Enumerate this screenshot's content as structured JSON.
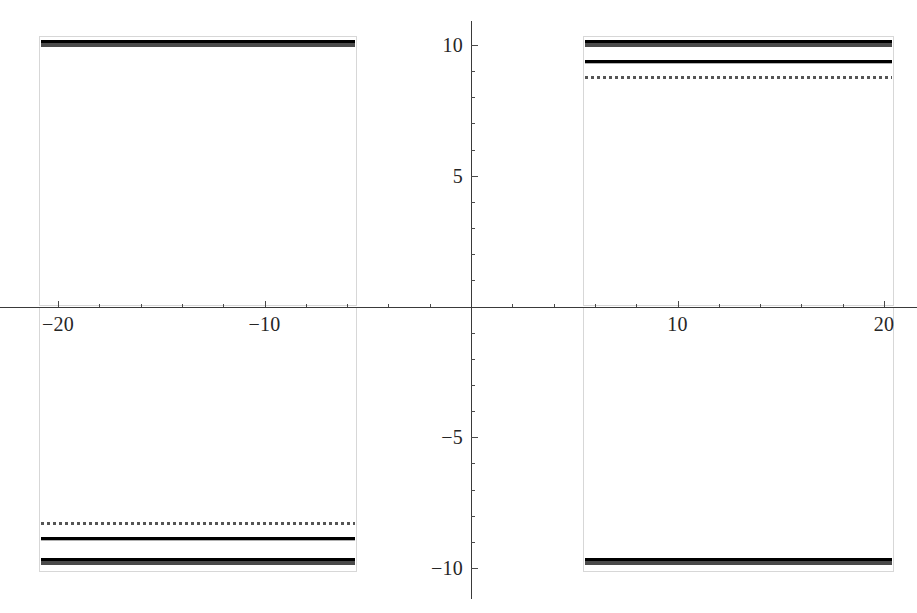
{
  "chart_data": {
    "type": "line",
    "title": "",
    "subtitle": "",
    "xlabel": "",
    "ylabel": "",
    "xlim": [
      -22.5,
      22.5
    ],
    "ylim": [
      -11.5,
      11.0
    ],
    "grid": false,
    "legend": "none",
    "axes_style": "cartesian-crosshair",
    "x_ticks_major": [
      -20,
      -10,
      10,
      20
    ],
    "x_ticks_major_labels": [
      "−20",
      "−10",
      "10",
      "20"
    ],
    "x_ticks_minor": [
      -18,
      -16,
      -14,
      -12,
      -8,
      -6,
      -4,
      -2,
      2,
      4,
      6,
      8,
      12,
      14,
      16,
      18
    ],
    "y_ticks_major": [
      10,
      5,
      -5,
      -10
    ],
    "y_ticks_major_labels": [
      "10",
      "5",
      "−5",
      "−10"
    ],
    "y_ticks_minor": [
      9,
      8,
      7,
      6,
      4,
      3,
      2,
      1,
      -1,
      -2,
      -3,
      -4,
      -6,
      -7,
      -8,
      -9
    ],
    "colors": {
      "curve_dark": "#4a4a4a",
      "curve_gray": "#b0b0b0",
      "curve_dotted": "#555555",
      "axis": "#3a3a3a",
      "frame": "#d7d7d7",
      "background": "#ffffff",
      "text": "#262626"
    },
    "x_gap_domain": [
      -5.5,
      5.5
    ],
    "series": [
      {
        "name": "upper-branch-dark",
        "style": "solid",
        "width_px": 7,
        "color": "#4a4a4a",
        "segments": [
          {
            "x": [
              -20.8,
              -5.6
            ],
            "y": [
              10.05,
              10.05
            ]
          },
          {
            "x": [
              5.5,
              20.4
            ],
            "y": [
              10.05,
              10.05
            ]
          }
        ]
      },
      {
        "name": "upper-branch-gray",
        "style": "solid",
        "width_px": 4,
        "color": "#b0b0b0",
        "segments": [
          {
            "x": [
              5.5,
              20.4
            ],
            "y": [
              9.35,
              9.35
            ]
          }
        ]
      },
      {
        "name": "upper-branch-dotted",
        "style": "dotted",
        "width_px": 4,
        "color": "#555555",
        "segments": [
          {
            "x": [
              5.5,
              20.4
            ],
            "y": [
              8.75,
              8.75
            ]
          }
        ]
      },
      {
        "name": "lower-branch-dotted",
        "style": "dotted",
        "width_px": 4,
        "color": "#555555",
        "segments": [
          {
            "x": [
              -20.8,
              -5.6
            ],
            "y": [
              -8.3,
              -8.3
            ]
          }
        ]
      },
      {
        "name": "lower-branch-gray",
        "style": "solid",
        "width_px": 4,
        "color": "#b0b0b0",
        "segments": [
          {
            "x": [
              -20.8,
              -5.6
            ],
            "y": [
              -8.9,
              -8.9
            ]
          }
        ]
      },
      {
        "name": "lower-branch-dark",
        "style": "solid",
        "width_px": 7,
        "color": "#4a4a4a",
        "segments": [
          {
            "x": [
              -20.8,
              -5.6
            ],
            "y": [
              -9.75,
              -9.75
            ]
          },
          {
            "x": [
              5.5,
              20.4
            ],
            "y": [
              -9.75,
              -9.75
            ]
          }
        ]
      }
    ],
    "panels": [
      {
        "name": "upper-left-panel",
        "x": [
          -20.9,
          -5.5
        ],
        "y": [
          10.35,
          0.0
        ]
      },
      {
        "name": "upper-right-panel",
        "x": [
          5.4,
          20.5
        ],
        "y": [
          10.35,
          0.0
        ]
      },
      {
        "name": "lower-left-panel",
        "x": [
          -20.9,
          -5.5
        ],
        "y": [
          0.0,
          -10.15
        ]
      },
      {
        "name": "lower-right-panel",
        "x": [
          5.4,
          20.5
        ],
        "y": [
          0.0,
          -10.15
        ]
      }
    ]
  }
}
